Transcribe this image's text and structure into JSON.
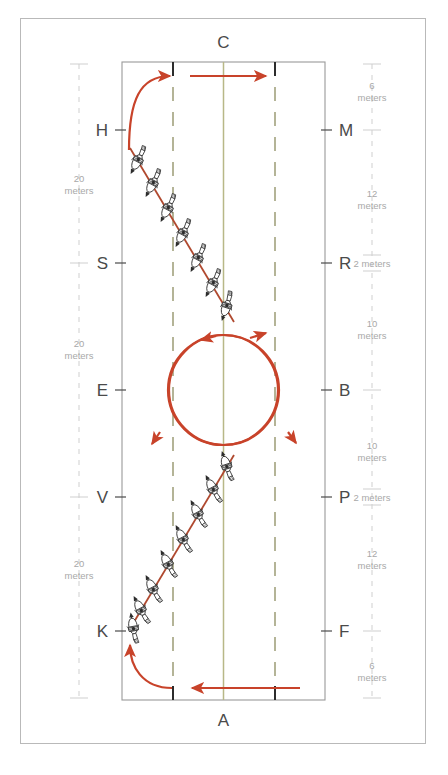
{
  "diagram": {
    "type": "dressage-arena",
    "colors": {
      "track_red": "#c8432a",
      "arena_outline": "#9a9a9a",
      "centerline_olive": "#b8b887",
      "quarterline_dash": "#9c9c76",
      "marker_text": "#4a4a4a",
      "measure_text": "#a8a8a8",
      "frame": "#b9b9b9",
      "horse_ink": "#2c2c2c"
    },
    "arena": {
      "top_label": "C",
      "bottom_label": "A"
    },
    "left_markers": [
      {
        "letter": "H",
        "y": 130
      },
      {
        "letter": "S",
        "y": 263
      },
      {
        "letter": "E",
        "y": 390
      },
      {
        "letter": "V",
        "y": 497
      },
      {
        "letter": "K",
        "y": 631
      }
    ],
    "right_markers": [
      {
        "letter": "M",
        "y": 130
      },
      {
        "letter": "R",
        "y": 263
      },
      {
        "letter": "B",
        "y": 390
      },
      {
        "letter": "P",
        "y": 497
      },
      {
        "letter": "F",
        "y": 631
      }
    ],
    "left_measures": [
      {
        "value": "20",
        "unit": "meters",
        "y": 185
      },
      {
        "value": "20",
        "unit": "meters",
        "y": 350
      },
      {
        "value": "20",
        "unit": "meters",
        "y": 570
      }
    ],
    "right_measures": [
      {
        "value": "6",
        "unit": "meters",
        "y": 92
      },
      {
        "value": "12",
        "unit": "meters",
        "y": 200
      },
      {
        "value": "2 meters",
        "unit": "",
        "y": 264
      },
      {
        "value": "10",
        "unit": "meters",
        "y": 330
      },
      {
        "value": "10",
        "unit": "meters",
        "y": 452
      },
      {
        "value": "2 meters",
        "unit": "",
        "y": 498
      },
      {
        "value": "12",
        "unit": "meters",
        "y": 560
      },
      {
        "value": "6",
        "unit": "meters",
        "y": 672
      }
    ],
    "figures": {
      "top_entry_arrow": "curve-from-H-to-top-then-right",
      "bottom_exit_arrow": "left-arrow-along-bottom-then-curve-up-to-K",
      "upper_diagonal": "half-pass-line-from-H-toward-centerline",
      "lower_diagonal": "half-pass-line-from-K-toward-centerline",
      "circles": "two-20m-circles-at-E-and-B-forming-figure-eight",
      "horse_count_upper": 7,
      "horse_count_lower": 8
    }
  }
}
